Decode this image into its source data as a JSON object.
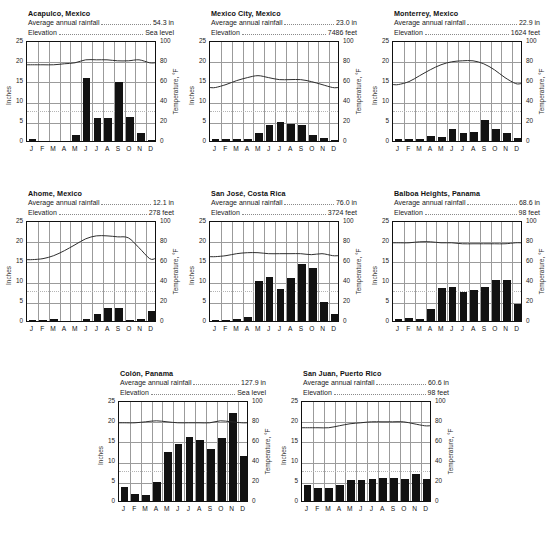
{
  "labels": {
    "rainfall_label": "Average annual rainfall",
    "elevation_label": "Elevation",
    "ylabel_left": "Inches",
    "ylabel_right": "Temperature, °F",
    "months": [
      "J",
      "F",
      "M",
      "A",
      "M",
      "J",
      "J",
      "A",
      "S",
      "O",
      "N",
      "D"
    ],
    "left_ticks": [
      "25",
      "20",
      "15",
      "10",
      "5",
      "0"
    ],
    "right_ticks": [
      "100",
      "80",
      "60",
      "40",
      "20",
      "0"
    ]
  },
  "chart_data": [
    {
      "type": "bar",
      "title": "Acapulco, Mexico",
      "rainfall": "54.3 in",
      "elevation": "Sea level",
      "xlabel": "",
      "ylabel": "Inches",
      "ylabel2": "Temperature, °F",
      "ylim": [
        0,
        25
      ],
      "ylim2": [
        0,
        100
      ],
      "grid": true,
      "categories": [
        "J",
        "F",
        "M",
        "A",
        "M",
        "J",
        "J",
        "A",
        "S",
        "O",
        "N",
        "D"
      ],
      "series": [
        {
          "name": "Rainfall (in)",
          "type": "bar",
          "values": [
            0.4,
            0.0,
            0.0,
            0.0,
            1.5,
            15.6,
            5.7,
            5.8,
            14.5,
            6.0,
            1.9,
            0.3
          ]
        },
        {
          "name": "Temperature (°F)",
          "type": "line",
          "values": [
            77,
            77,
            77,
            78,
            79,
            82,
            82,
            82,
            81,
            81,
            82,
            79
          ]
        }
      ]
    },
    {
      "type": "bar",
      "title": "Mexico City, Mexico",
      "rainfall": "23.0 in",
      "elevation": "7486 feet",
      "xlabel": "",
      "ylabel": "Inches",
      "ylabel2": "Temperature, °F",
      "ylim": [
        0,
        25
      ],
      "ylim2": [
        0,
        100
      ],
      "grid": true,
      "categories": [
        "J",
        "F",
        "M",
        "A",
        "M",
        "J",
        "J",
        "A",
        "S",
        "O",
        "N",
        "D"
      ],
      "series": [
        {
          "name": "Rainfall (in)",
          "type": "bar",
          "values": [
            0.4,
            0.4,
            0.4,
            0.6,
            2.1,
            3.9,
            4.7,
            4.3,
            4.0,
            1.6,
            0.7,
            0.3
          ]
        },
        {
          "name": "Temperature (°F)",
          "type": "line",
          "values": [
            54,
            57,
            61,
            64,
            66,
            64,
            62,
            62,
            62,
            60,
            57,
            54
          ]
        }
      ]
    },
    {
      "type": "bar",
      "title": "Monterrey, Mexico",
      "rainfall": "22.9 in",
      "elevation": "1624 feet",
      "xlabel": "",
      "ylabel": "Inches",
      "ylabel2": "Temperature, °F",
      "ylim": [
        0,
        25
      ],
      "ylim2": [
        0,
        100
      ],
      "grid": true,
      "categories": [
        "J",
        "F",
        "M",
        "A",
        "M",
        "J",
        "J",
        "A",
        "S",
        "O",
        "N",
        "D"
      ],
      "series": [
        {
          "name": "Rainfall (in)",
          "type": "bar",
          "values": [
            0.5,
            0.5,
            0.6,
            1.2,
            0.9,
            2.9,
            2.1,
            2.2,
            5.1,
            3.0,
            1.9,
            0.8
          ]
        },
        {
          "name": "Temperature (°F)",
          "type": "line",
          "values": [
            57,
            60,
            66,
            72,
            77,
            80,
            81,
            81,
            78,
            72,
            64,
            58
          ]
        }
      ]
    },
    {
      "type": "bar",
      "title": "Ahome, Mexico",
      "rainfall": "12.1 in",
      "elevation": "278 feet",
      "xlabel": "",
      "ylabel": "Inches",
      "ylabel2": "Temperature, °F",
      "ylim": [
        0,
        25
      ],
      "ylim2": [
        0,
        100
      ],
      "grid": true,
      "categories": [
        "J",
        "F",
        "M",
        "A",
        "M",
        "J",
        "J",
        "A",
        "S",
        "O",
        "N",
        "D"
      ],
      "series": [
        {
          "name": "Rainfall (in)",
          "type": "bar",
          "values": [
            0.1,
            0.3,
            0.5,
            0.0,
            0.0,
            0.5,
            1.7,
            3.1,
            3.1,
            0.3,
            0.5,
            2.5
          ]
        },
        {
          "name": "Temperature (°F)",
          "type": "line",
          "values": [
            62,
            63,
            66,
            71,
            77,
            83,
            86,
            86,
            85,
            84,
            74,
            63
          ]
        }
      ]
    },
    {
      "type": "bar",
      "title": "San José, Costa Rica",
      "rainfall": "76.0 in",
      "elevation": "3724 feet",
      "xlabel": "",
      "ylabel": "Inches",
      "ylabel2": "Temperature, °F",
      "ylim": [
        0,
        25
      ],
      "ylim2": [
        0,
        100
      ],
      "grid": true,
      "categories": [
        "J",
        "F",
        "M",
        "A",
        "M",
        "J",
        "J",
        "A",
        "S",
        "O",
        "N",
        "D"
      ],
      "series": [
        {
          "name": "Rainfall (in)",
          "type": "bar",
          "values": [
            0.2,
            0.1,
            0.4,
            0.9,
            9.9,
            11.0,
            7.9,
            10.7,
            14.2,
            13.2,
            4.8,
            1.7
          ]
        },
        {
          "name": "Temperature (°F)",
          "type": "line",
          "values": [
            65,
            66,
            68,
            69,
            69,
            68,
            68,
            68,
            68,
            67,
            68,
            66
          ]
        }
      ]
    },
    {
      "type": "bar",
      "title": "Balboa Heights, Panama",
      "rainfall": "68.6 in",
      "elevation": "98 feet",
      "xlabel": "",
      "ylabel": "Inches",
      "ylabel2": "Temperature, °F",
      "ylim": [
        0,
        25
      ],
      "ylim2": [
        0,
        100
      ],
      "grid": true,
      "categories": [
        "J",
        "F",
        "M",
        "A",
        "M",
        "J",
        "J",
        "A",
        "S",
        "O",
        "N",
        "D"
      ],
      "series": [
        {
          "name": "Rainfall (in)",
          "type": "bar",
          "values": [
            0.6,
            0.7,
            0.5,
            3.0,
            8.1,
            8.4,
            7.2,
            7.8,
            8.3,
            10.1,
            10.1,
            4.3
          ]
        },
        {
          "name": "Temperature (°F)",
          "type": "line",
          "values": [
            79,
            79,
            80,
            80,
            79,
            79,
            78,
            78,
            78,
            78,
            78,
            79
          ]
        }
      ]
    },
    {
      "type": "bar",
      "title": "Colón, Panama",
      "rainfall": "127.9 in",
      "elevation": "Sea level",
      "xlabel": "",
      "ylabel": "Inches",
      "ylabel2": "Temperature, °F",
      "ylim": [
        0,
        25
      ],
      "ylim2": [
        0,
        100
      ],
      "grid": true,
      "categories": [
        "J",
        "F",
        "M",
        "A",
        "M",
        "J",
        "J",
        "A",
        "S",
        "O",
        "N",
        "D"
      ],
      "series": [
        {
          "name": "Rainfall (in)",
          "type": "bar",
          "values": [
            3.4,
            1.8,
            1.6,
            4.6,
            12.1,
            14.0,
            15.8,
            15.0,
            12.9,
            15.5,
            21.7,
            11.1
          ]
        },
        {
          "name": "Temperature (°F)",
          "type": "line",
          "values": [
            79,
            79,
            80,
            81,
            80,
            79,
            79,
            79,
            79,
            81,
            80,
            79
          ]
        }
      ]
    },
    {
      "type": "bar",
      "title": "San Juan, Puerto Rico",
      "rainfall": "60.6 in",
      "elevation": "98 feet",
      "xlabel": "",
      "ylabel": "Inches",
      "ylabel2": "Temperature, °F",
      "ylim": [
        0,
        25
      ],
      "ylim2": [
        0,
        100
      ],
      "grid": true,
      "categories": [
        "J",
        "F",
        "M",
        "A",
        "M",
        "J",
        "J",
        "A",
        "S",
        "O",
        "N",
        "D"
      ],
      "series": [
        {
          "name": "Rainfall (in)",
          "type": "bar",
          "values": [
            4.0,
            3.1,
            3.1,
            3.9,
            5.3,
            5.2,
            5.5,
            5.6,
            5.6,
            5.5,
            6.7,
            5.4
          ]
        },
        {
          "name": "Temperature (°F)",
          "type": "line",
          "values": [
            74,
            74,
            74,
            76,
            78,
            79,
            80,
            80,
            80,
            80,
            78,
            76
          ]
        }
      ]
    }
  ],
  "layout": {
    "rows": [
      [
        0,
        1,
        2
      ],
      [
        3,
        4,
        5
      ],
      [
        6,
        7
      ]
    ]
  },
  "colors": {
    "bar": "#121212",
    "line": "#2a2a2a",
    "grid": "#9b9b9b",
    "axis": "#111111",
    "background": "#ffffff"
  }
}
